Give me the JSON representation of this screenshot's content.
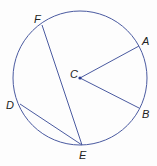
{
  "diagram": {
    "type": "circle-geometry",
    "line_color": "#4a5aa0",
    "circle": {
      "center": "C",
      "cx": 80,
      "cy": 78,
      "r": 67
    },
    "points": [
      {
        "name": "A",
        "x": 139,
        "y": 46,
        "label_x": 142,
        "label_y": 45
      },
      {
        "name": "B",
        "x": 139,
        "y": 108,
        "label_x": 142,
        "label_y": 118
      },
      {
        "name": "C",
        "x": 80,
        "y": 78,
        "label_x": 70,
        "label_y": 78
      },
      {
        "name": "D",
        "x": 20,
        "y": 104,
        "label_x": 6,
        "label_y": 109
      },
      {
        "name": "E",
        "x": 82,
        "y": 145,
        "label_x": 79,
        "label_y": 159
      },
      {
        "name": "F",
        "x": 42,
        "y": 25,
        "label_x": 34,
        "label_y": 23
      }
    ],
    "segments": [
      {
        "from": "C",
        "to": "A",
        "kind": "radius"
      },
      {
        "from": "C",
        "to": "B",
        "kind": "radius"
      },
      {
        "from": "F",
        "to": "E",
        "kind": "chord"
      },
      {
        "from": "D",
        "to": "E",
        "kind": "chord"
      }
    ]
  }
}
